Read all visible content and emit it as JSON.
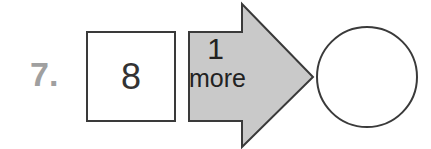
{
  "problem": {
    "number_label": "7.",
    "start_value": "8",
    "operation": {
      "amount": "1",
      "word": "more"
    },
    "result_value": ""
  },
  "colors": {
    "arrow_fill": "#c9c9c9",
    "stroke": "#3a3a3a",
    "number_label": "#a0a0a0"
  }
}
